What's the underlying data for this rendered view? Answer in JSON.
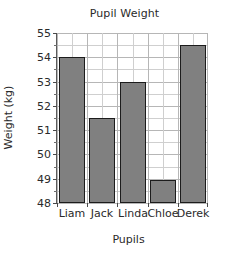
{
  "chart_data": {
    "type": "bar",
    "title": "Pupil Weight",
    "xlabel": "Pupils",
    "ylabel": "Weight (kg)",
    "categories": [
      "Liam",
      "Jack",
      "Linda",
      "Chloe",
      "Derek"
    ],
    "values": [
      54,
      51.5,
      53,
      48.95,
      54.5
    ],
    "ylim": [
      48,
      55
    ],
    "ytick_labels": [
      "48",
      "49",
      "50",
      "51",
      "52",
      "53",
      "54",
      "55"
    ],
    "ytick_values": [
      48,
      49,
      50,
      51,
      52,
      53,
      54,
      55
    ],
    "yminor_step": 0.5,
    "grid": true,
    "legend": "none",
    "bar_color": "#808080",
    "bar_edge_color": "#1c1c1c",
    "grid_color": "#cfcfcf",
    "axis_color": "#5a5a5a",
    "text_color": "#2a2a2a"
  }
}
